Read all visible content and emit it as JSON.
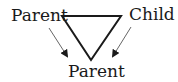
{
  "diagram": {
    "labels": {
      "top_left": "Parent",
      "top_right": "Child",
      "bottom": "Parent"
    },
    "shape": "inverted-triangle",
    "arrows": [
      {
        "from": "top_left",
        "to": "bottom"
      },
      {
        "from": "top_right",
        "to": "bottom"
      }
    ],
    "colors": {
      "stroke": "#1a1a1a",
      "arrow": "#555555",
      "background": "#ffffff"
    }
  }
}
